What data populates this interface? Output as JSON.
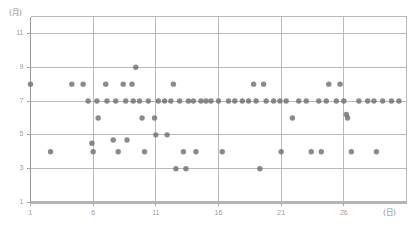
{
  "chart_data": {
    "type": "scatter",
    "title": "",
    "xlabel": "(日)",
    "ylabel": "(月)",
    "xlim": [
      1,
      31
    ],
    "ylim": [
      1,
      12
    ],
    "grid": true,
    "legend": null,
    "xticks": [
      1,
      6,
      11,
      16,
      21,
      26
    ],
    "yticks": [
      1,
      3,
      5,
      7,
      9,
      11
    ],
    "xtick_labels": [
      "1",
      "6",
      "11",
      "16",
      "21",
      "26"
    ],
    "ytick_labels": [
      "1",
      "3",
      "5",
      "7",
      "9",
      "11"
    ],
    "marker_color": "#6f7072",
    "grid_color": "#b9b9b9",
    "axis_color": "#9a9a9a",
    "points": [
      {
        "x": 1.0,
        "y": 8.0
      },
      {
        "x": 2.6,
        "y": 4.0
      },
      {
        "x": 4.3,
        "y": 8.0
      },
      {
        "x": 5.2,
        "y": 8.0
      },
      {
        "x": 5.6,
        "y": 7.0
      },
      {
        "x": 5.9,
        "y": 4.5
      },
      {
        "x": 6.0,
        "y": 4.0
      },
      {
        "x": 6.3,
        "y": 7.0
      },
      {
        "x": 6.4,
        "y": 6.0
      },
      {
        "x": 7.0,
        "y": 8.0
      },
      {
        "x": 7.1,
        "y": 7.0
      },
      {
        "x": 7.6,
        "y": 4.7
      },
      {
        "x": 7.8,
        "y": 7.0
      },
      {
        "x": 8.0,
        "y": 4.0
      },
      {
        "x": 8.4,
        "y": 8.0
      },
      {
        "x": 8.6,
        "y": 7.0
      },
      {
        "x": 8.7,
        "y": 4.7
      },
      {
        "x": 9.1,
        "y": 8.0
      },
      {
        "x": 9.2,
        "y": 7.0
      },
      {
        "x": 9.4,
        "y": 9.0
      },
      {
        "x": 9.7,
        "y": 7.0
      },
      {
        "x": 9.9,
        "y": 6.0
      },
      {
        "x": 10.1,
        "y": 4.0
      },
      {
        "x": 10.4,
        "y": 7.0
      },
      {
        "x": 10.9,
        "y": 6.0
      },
      {
        "x": 11.0,
        "y": 5.0
      },
      {
        "x": 11.2,
        "y": 7.0
      },
      {
        "x": 11.7,
        "y": 7.0
      },
      {
        "x": 11.9,
        "y": 5.0
      },
      {
        "x": 12.2,
        "y": 7.0
      },
      {
        "x": 12.4,
        "y": 8.0
      },
      {
        "x": 12.6,
        "y": 3.0
      },
      {
        "x": 12.9,
        "y": 7.0
      },
      {
        "x": 13.2,
        "y": 4.0
      },
      {
        "x": 13.4,
        "y": 3.0
      },
      {
        "x": 13.6,
        "y": 7.0
      },
      {
        "x": 14.0,
        "y": 7.0
      },
      {
        "x": 14.2,
        "y": 4.0
      },
      {
        "x": 14.6,
        "y": 7.0
      },
      {
        "x": 15.0,
        "y": 7.0
      },
      {
        "x": 15.4,
        "y": 7.0
      },
      {
        "x": 16.0,
        "y": 7.0
      },
      {
        "x": 16.3,
        "y": 4.0
      },
      {
        "x": 16.8,
        "y": 7.0
      },
      {
        "x": 17.3,
        "y": 7.0
      },
      {
        "x": 17.9,
        "y": 7.0
      },
      {
        "x": 18.4,
        "y": 7.0
      },
      {
        "x": 18.8,
        "y": 8.0
      },
      {
        "x": 19.0,
        "y": 7.0
      },
      {
        "x": 19.3,
        "y": 3.0
      },
      {
        "x": 19.6,
        "y": 8.0
      },
      {
        "x": 19.8,
        "y": 7.0
      },
      {
        "x": 20.4,
        "y": 7.0
      },
      {
        "x": 20.9,
        "y": 7.0
      },
      {
        "x": 21.0,
        "y": 4.0
      },
      {
        "x": 21.4,
        "y": 7.0
      },
      {
        "x": 21.9,
        "y": 6.0
      },
      {
        "x": 22.4,
        "y": 7.0
      },
      {
        "x": 23.0,
        "y": 7.0
      },
      {
        "x": 23.4,
        "y": 4.0
      },
      {
        "x": 24.0,
        "y": 7.0
      },
      {
        "x": 24.2,
        "y": 4.0
      },
      {
        "x": 24.6,
        "y": 7.0
      },
      {
        "x": 24.8,
        "y": 8.0
      },
      {
        "x": 25.4,
        "y": 7.0
      },
      {
        "x": 25.7,
        "y": 8.0
      },
      {
        "x": 26.0,
        "y": 7.0
      },
      {
        "x": 26.2,
        "y": 6.2
      },
      {
        "x": 26.3,
        "y": 6.0
      },
      {
        "x": 26.6,
        "y": 4.0
      },
      {
        "x": 27.2,
        "y": 7.0
      },
      {
        "x": 27.9,
        "y": 7.0
      },
      {
        "x": 28.4,
        "y": 7.0
      },
      {
        "x": 28.6,
        "y": 4.0
      },
      {
        "x": 29.1,
        "y": 7.0
      },
      {
        "x": 29.8,
        "y": 7.0
      },
      {
        "x": 30.4,
        "y": 7.0
      }
    ]
  }
}
